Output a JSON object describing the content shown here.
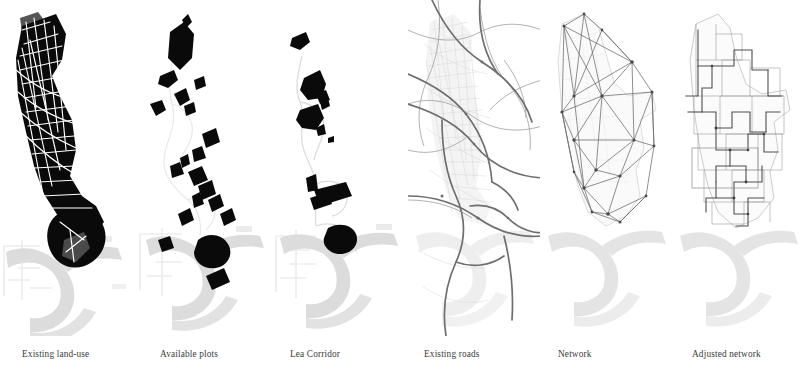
{
  "figure": {
    "kind": "map-series",
    "background": "#ffffff",
    "panel_count": 6,
    "panel_width": 134,
    "panel_height": 336
  },
  "palette": {
    "built_mass": "#0a0a0a",
    "built_mass_secondary": "#4f4f4f",
    "river": "#dcdcdc",
    "river_edge": "#cfcfcf",
    "context_faint": "#ededed",
    "road_major": "#6e6e6e",
    "road_minor": "#b4b4b4",
    "road_hair": "#d2d2d2",
    "network_edge": "#6a6a6a",
    "network_node": "#4a4a4a",
    "boundary": "#9a9a9a",
    "highlight_box": "#8a8a8a",
    "caption_text": "#3b3b3b",
    "white": "#ffffff"
  },
  "panels": [
    {
      "id": "existing-land-use",
      "caption": "Existing land-use",
      "description": "Solid black urban block mass of the Lea Valley corridor cut by white street lines; grey wedge at north; Thames meander in light grey at the south.",
      "fill_style": "solid-black-with-white-streets",
      "river_visible": true
    },
    {
      "id": "available-plots",
      "caption": "Available plots",
      "description": "Scattered black development plot polygons along the corridor over a faint waterway trace and the grey Thames meander.",
      "fill_style": "scattered-black-polygons",
      "river_visible": true
    },
    {
      "id": "lea-corridor",
      "caption": "Lea Corridor",
      "description": "A small number of larger black plots strung along the thin Lea waterway line, with the grey Thames meander below.",
      "fill_style": "sparse-black-polygons",
      "river_visible": true
    },
    {
      "id": "existing-roads",
      "caption": "Existing roads",
      "description": "Grey road network: thick arterial roads crossing the frame over a fine mesh of minor streets; faint Thames meander at the south.",
      "fill_style": "grey-road-lines",
      "river_visible": true
    },
    {
      "id": "network",
      "caption": "Network",
      "description": "Abstract triangulated graph of straight edges between junction nodes, drawn over the faint study-area boundary outline.",
      "fill_style": "straight-edge-graph",
      "river_visible": true
    },
    {
      "id": "adjusted-network",
      "caption": "Adjusted network",
      "description": "Orthogonalised network snapped to block edges, with a rectangular highlight frame over the central zone.",
      "fill_style": "orthogonal-network-with-highlight",
      "river_visible": true,
      "highlight_box": true
    }
  ]
}
